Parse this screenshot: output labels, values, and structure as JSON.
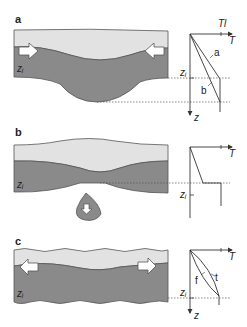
{
  "panels": [
    {
      "id": "a",
      "label": "a",
      "depth_label": "zᵢ",
      "arrows": "inward",
      "graph": {
        "x_axis": "T",
        "y_axis": "z",
        "top_label": "Tl",
        "z_marker": "zᵢ",
        "curves": [
          "a",
          "b"
        ]
      }
    },
    {
      "id": "b",
      "label": "b",
      "depth_label": "zᵢ",
      "arrows": "downward-drip",
      "graph": {
        "x_axis": "T",
        "y_axis": "z",
        "z_marker": "zᵢ",
        "curves": []
      }
    },
    {
      "id": "c",
      "label": "c",
      "depth_label": "zᵢ",
      "arrows": "outward",
      "graph": {
        "x_axis": "T",
        "y_axis": "z",
        "z_marker": "zᵢ",
        "curves": [
          "f",
          "t"
        ]
      }
    }
  ],
  "colors": {
    "upper_layer": "#e2e2e2",
    "lower_layer": "#8a8a8a",
    "outline": "#555555",
    "arrow_fill": "#ffffff",
    "axis": "#333333"
  }
}
